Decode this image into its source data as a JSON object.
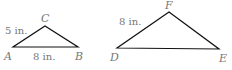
{
  "figure": {
    "triangles": [
      {
        "name": "ABC",
        "vertices": {
          "A": {
            "label": "A",
            "x": 13,
            "y": 47
          },
          "B": {
            "label": "B",
            "x": 78,
            "y": 47
          },
          "C": {
            "label": "C",
            "x": 45,
            "y": 26
          }
        },
        "side_labels": {
          "AC": "5 in.",
          "AB": "8 in."
        }
      },
      {
        "name": "DEF",
        "vertices": {
          "D": {
            "label": "D",
            "x": 117,
            "y": 48
          },
          "E": {
            "label": "E",
            "x": 219,
            "y": 49
          },
          "F": {
            "label": "F",
            "x": 169,
            "y": 12
          }
        },
        "side_labels": {
          "DF": "8 in."
        }
      }
    ],
    "colors": {
      "edge": "#111111",
      "label": "#777777",
      "background": "#ffffff"
    }
  }
}
